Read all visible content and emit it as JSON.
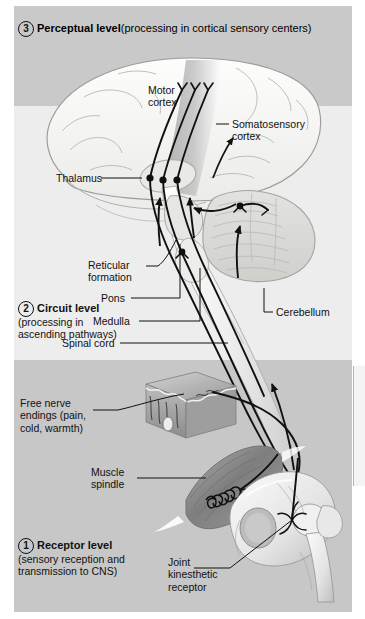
{
  "figure": {
    "background_bands": {
      "top_color": "#c9c9c9",
      "middle_color": "#ededed",
      "bottom_color": "#c7c7c7"
    }
  },
  "levels": [
    {
      "number": "3",
      "title": "Perceptual level",
      "description": "(processing in cortical sensory centers)",
      "inline": true
    },
    {
      "number": "2",
      "title": "Circuit level",
      "description_line1": "(processing in",
      "description_line2": "ascending pathways)",
      "inline": false
    },
    {
      "number": "1",
      "title": "Receptor level",
      "description_line1": "(sensory reception and",
      "description_line2": "transmission to CNS)",
      "inline": false
    }
  ],
  "labels": {
    "motor_cortex_line1": "Motor",
    "motor_cortex_line2": "cortex",
    "somatosensory_line1": "Somatosensory",
    "somatosensory_line2": "cortex",
    "thalamus": "Thalamus",
    "reticular_line1": "Reticular",
    "reticular_line2": "formation",
    "pons": "Pons",
    "medulla": "Medulla",
    "spinal_cord": "Spinal cord",
    "cerebellum": "Cerebellum",
    "free_nerve_line1": "Free nerve",
    "free_nerve_line2": "endings (pain,",
    "free_nerve_line3": "cold, warmth)",
    "muscle_line1": "Muscle",
    "muscle_line2": "spindle",
    "joint_line1": "Joint",
    "joint_line2": "kinesthetic",
    "joint_line3": "receptor"
  },
  "structures": {
    "brain": "cerebrum-lateral-view",
    "cerebellum": "cerebellum",
    "brainstem": "brainstem-pons-medulla",
    "spinal_cord": "spinal-cord",
    "skin_block": "skin-cross-section-block",
    "muscle": "skeletal-muscle-with-spindle",
    "hip_joint": "hip-joint-bone"
  },
  "colors": {
    "ink": "#111111",
    "brain_fill": "#f7f7f5",
    "cortex_band": "#b9b9b9",
    "cerebellum_fill": "#dcdcdc",
    "muscle_fill": "#8e8e8e",
    "bone_fill": "#f2f2f2",
    "skin_fill": "#a8a8a8"
  }
}
